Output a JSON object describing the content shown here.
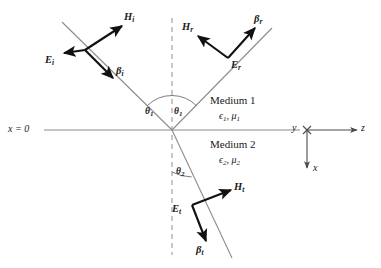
{
  "figure": {
    "name": "oblique-incidence-plane-wave-reflection-refraction",
    "interface_label": "x = 0",
    "incident": {
      "h_base": "H",
      "h_sub": "i",
      "e_base": "E",
      "e_sub": "i",
      "beta_base": "β",
      "beta_sub": "i"
    },
    "reflected": {
      "h_base": "H",
      "h_sub": "r",
      "e_base": "E",
      "e_sub": "r",
      "beta_base": "β",
      "beta_sub": "r"
    },
    "transmitted": {
      "h_base": "H",
      "h_sub": "t",
      "e_base": "E",
      "e_sub": "t",
      "beta_base": "β",
      "beta_sub": "t"
    },
    "angles": {
      "incidence_base": "θ",
      "incidence_sub": "1",
      "reflection_base": "θ",
      "reflection_sub": "1",
      "transmission_base": "θ",
      "transmission_sub": "2"
    },
    "media": {
      "upper_title": "Medium 1",
      "upper_permittivity": "ϵ",
      "upper_permittivity_sub": "1",
      "upper_separator": ", ",
      "upper_permeability": "μ",
      "upper_permeability_sub": "1",
      "lower_title": "Medium 2",
      "lower_permittivity": "ϵ",
      "lower_permittivity_sub": "2",
      "lower_separator": ", ",
      "lower_permeability": "μ",
      "lower_permeability_sub": "2"
    },
    "axes": {
      "y_label": "y",
      "z_label": "z",
      "x_label": "x"
    },
    "colors": {
      "ray": "#8c8c8c",
      "vector": "#111111",
      "interface": "#8c8c8c",
      "normal_dashed": "#9a9a9a",
      "text": "#1a1a1a"
    }
  }
}
